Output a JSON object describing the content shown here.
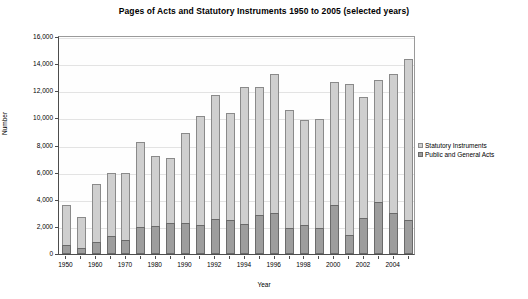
{
  "chart_data": {
    "type": "bar",
    "stacked": true,
    "title": "Pages of Acts and Statutory Instruments 1950 to 2005 (selected years)",
    "xlabel": "Year",
    "ylabel": "Number",
    "ylim": [
      0,
      16000
    ],
    "ytick_values": [
      0,
      2000,
      4000,
      6000,
      8000,
      10000,
      12000,
      14000,
      16000
    ],
    "ytick_labels": [
      "0",
      "2,000",
      "4,000",
      "6,000",
      "8,000",
      "10,000",
      "12,000",
      "14,000",
      "16,000"
    ],
    "grid": true,
    "legend_position": "right",
    "categories": [
      "1950",
      "1955",
      "1960",
      "1965",
      "1970",
      "1975",
      "1980",
      "1985",
      "1990",
      "1991",
      "1992",
      "1993",
      "1994",
      "1995",
      "1996",
      "1997",
      "1998",
      "1999",
      "2000",
      "2001",
      "2002",
      "2003",
      "2004",
      "2005"
    ],
    "xtick_labels": [
      "1950",
      "",
      "1960",
      "",
      "1970",
      "",
      "1980",
      "",
      "1990",
      "",
      "1992",
      "",
      "1994",
      "",
      "1996",
      "",
      "1998",
      "",
      "2000",
      "",
      "2002",
      "",
      "2004",
      ""
    ],
    "series": [
      {
        "name": "Public and General Acts",
        "color": "#9d9d9d",
        "values": [
          700,
          450,
          850,
          1300,
          1050,
          2000,
          2050,
          2250,
          2300,
          2150,
          2550,
          2500,
          2200,
          2900,
          3000,
          1900,
          2150,
          1950,
          3650,
          1400,
          2650,
          3850,
          3050,
          2500
        ]
      },
      {
        "name": "Statutory Instruments",
        "color": "#cfcfcf",
        "values": [
          2950,
          2300,
          4300,
          4700,
          4900,
          6250,
          5200,
          4800,
          6600,
          8050,
          9150,
          7900,
          10100,
          9400,
          10300,
          8700,
          7700,
          8000,
          9050,
          11150,
          8950,
          8950,
          10250,
          11900
        ]
      }
    ],
    "totals": [
      3650,
      2750,
      5150,
      6000,
      5950,
      8250,
      7250,
      7050,
      8900,
      10200,
      11700,
      10400,
      12300,
      12300,
      13300,
      10600,
      9850,
      9950,
      12700,
      12550,
      11600,
      12800,
      13300,
      14400
    ]
  },
  "legend": {
    "items": [
      {
        "label": "Statutory Instruments"
      },
      {
        "label": "Public and General Acts"
      }
    ]
  }
}
